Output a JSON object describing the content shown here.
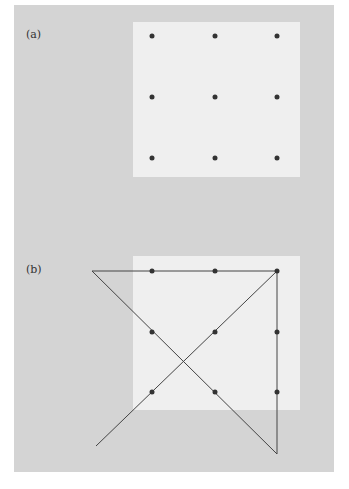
{
  "figure": {
    "background_color": "#d4d4d4",
    "panel_color": "#efefef",
    "dot_color": "#333333",
    "line_color": "#444444"
  },
  "panel_a": {
    "label": "(a)",
    "dots": [
      [
        152,
        36
      ],
      [
        215,
        36
      ],
      [
        277,
        36
      ],
      [
        152,
        97
      ],
      [
        215,
        97
      ],
      [
        277,
        97
      ],
      [
        152,
        158
      ],
      [
        215,
        158
      ],
      [
        277,
        158
      ]
    ]
  },
  "panel_b": {
    "label": "(b)",
    "dots": [
      [
        152,
        271
      ],
      [
        215,
        271
      ],
      [
        277,
        271
      ],
      [
        152,
        332
      ],
      [
        215,
        332
      ],
      [
        277,
        332
      ],
      [
        152,
        392
      ],
      [
        215,
        392
      ],
      [
        277,
        392
      ]
    ],
    "path": [
      [
        96,
        446
      ],
      [
        277,
        271
      ],
      [
        277,
        454
      ],
      [
        92,
        271
      ],
      [
        277,
        271
      ]
    ]
  }
}
